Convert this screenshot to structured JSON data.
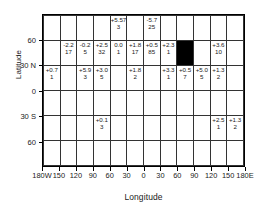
{
  "chart_data": {
    "type": "heatmap",
    "title": "",
    "xlabel": "Longitude",
    "ylabel": "Latitude",
    "xlim": [
      -180,
      180
    ],
    "ylim": [
      -90,
      90
    ],
    "grid": true,
    "legend": null,
    "cell_size_deg": {
      "lon": 30,
      "lat": 30
    },
    "x_tick_labels": [
      "180W",
      "150",
      "120",
      "90",
      "60",
      "30",
      "0",
      "30",
      "60",
      "90",
      "120",
      "150",
      "180E"
    ],
    "x_tick_values": [
      -180,
      -150,
      -120,
      -90,
      -60,
      -30,
      0,
      30,
      60,
      90,
      120,
      150,
      180
    ],
    "y_tick_labels": [
      "60",
      "30 N",
      "0",
      "30 S",
      "60"
    ],
    "y_tick_values": [
      60,
      30,
      0,
      -30,
      -60
    ],
    "cell_fields": [
      "value",
      "count"
    ],
    "filled_cell_note": "solid black cell at 60E-90E, 30N-60N",
    "rows": [
      {
        "lat_range": [
          60,
          90
        ],
        "cells": [
          null,
          null,
          null,
          null,
          {
            "value": "+5.57",
            "count": "3"
          },
          null,
          {
            "value": "-5.7",
            "count": "25"
          },
          null,
          null,
          null,
          null,
          null
        ]
      },
      {
        "lat_range": [
          30,
          60
        ],
        "cells": [
          null,
          {
            "value": "-2.2",
            "count": "17"
          },
          {
            "value": "-0.2",
            "count": "5"
          },
          {
            "value": "+2.5",
            "count": "32"
          },
          {
            "value": "0.0",
            "count": "1"
          },
          {
            "value": "+1.8",
            "count": "17"
          },
          {
            "value": "+0.5",
            "count": "85"
          },
          {
            "value": "+2.3",
            "count": "1"
          },
          {
            "value": "",
            "count": "",
            "filled": true
          },
          null,
          {
            "value": "+3.6",
            "count": "10"
          },
          null
        ]
      },
      {
        "lat_range": [
          0,
          30
        ],
        "cells": [
          {
            "value": "+0.7",
            "count": "1"
          },
          null,
          {
            "value": "+5.9",
            "count": "3"
          },
          {
            "value": "+3.0",
            "count": "5"
          },
          null,
          {
            "value": "+1.8",
            "count": "2"
          },
          null,
          {
            "value": "+3.3",
            "count": "1"
          },
          {
            "value": "+0.5",
            "count": "7"
          },
          {
            "value": "+5.0",
            "count": "5"
          },
          {
            "value": "+1.3",
            "count": "2"
          },
          null
        ]
      },
      {
        "lat_range": [
          -30,
          0
        ],
        "cells": [
          null,
          null,
          null,
          null,
          null,
          null,
          null,
          null,
          null,
          null,
          null,
          null
        ]
      },
      {
        "lat_range": [
          -60,
          -30
        ],
        "cells": [
          null,
          null,
          null,
          {
            "value": "+0.1",
            "count": "3"
          },
          null,
          null,
          null,
          null,
          null,
          null,
          {
            "value": "+2.5",
            "count": "1"
          },
          {
            "value": "+1.3",
            "count": "2"
          }
        ]
      },
      {
        "lat_range": [
          -90,
          -60
        ],
        "cells": [
          null,
          null,
          null,
          null,
          null,
          null,
          null,
          null,
          null,
          null,
          null,
          null
        ]
      }
    ]
  },
  "axes": {
    "x_title": "Longitude",
    "y_title": "Latitude"
  },
  "colors": {
    "filled_cell": "#000000",
    "grid_line": "#333333",
    "frame": "#000000",
    "text": "#1a1a1a",
    "background": "#ffffff"
  }
}
